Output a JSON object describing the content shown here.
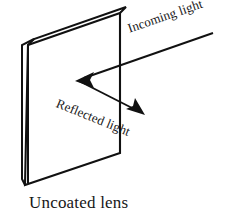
{
  "figure": {
    "caption": "Uncoated lens",
    "background_color": "#ffffff",
    "stroke_color": "#111111",
    "labels": {
      "incoming": "Incoming light",
      "reflected": "Reflected light"
    },
    "object": {
      "name": "uncoated-lens",
      "shape": "rectangular slab in oblique projection",
      "front_face_points": "28,45 120,13 120,153 25,185",
      "edge_top_points": "28,45 34,39 126,7 120,13",
      "edge_left_points": "28,45 22,39 22,179 25,185"
    },
    "rays": [
      {
        "name": "incoming-light-ray",
        "from_x": 213,
        "from_y": 33,
        "to_x": 80,
        "to_y": 79,
        "arrowhead": "end",
        "label": "Incoming light",
        "label_angle_deg": -19
      },
      {
        "name": "reflected-light-ray",
        "from_x": 79,
        "from_y": 80,
        "to_x": 141,
        "to_y": 112,
        "arrowhead": "end",
        "label": "Reflected light",
        "label_angle_deg": 22
      }
    ],
    "arrow_heads": [
      {
        "name": "incoming-light-arrowhead",
        "points": "76,80 93,73 90,80 93,87"
      },
      {
        "name": "reflected-light-arrowhead",
        "points": "144,114 127,108 133,105 134,99"
      }
    ]
  }
}
